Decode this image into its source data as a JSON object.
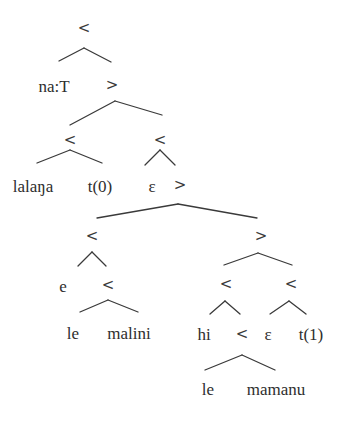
{
  "diagram": {
    "type": "syntax-tree",
    "nodes": [
      {
        "id": "n0",
        "label": "<",
        "x": 84,
        "y": 28,
        "kind": "operator"
      },
      {
        "id": "n1",
        "label": "na:T",
        "x": 54,
        "y": 86,
        "kind": "word"
      },
      {
        "id": "n2",
        "label": ">",
        "x": 112,
        "y": 85,
        "kind": "operator"
      },
      {
        "id": "n3",
        "label": "<",
        "x": 70,
        "y": 140,
        "kind": "operator"
      },
      {
        "id": "n4",
        "label": "<",
        "x": 160,
        "y": 140,
        "kind": "operator"
      },
      {
        "id": "n5",
        "label": "lalaŋa",
        "x": 33,
        "y": 186,
        "kind": "word"
      },
      {
        "id": "n6",
        "label": "t(0)",
        "x": 100,
        "y": 186,
        "kind": "word"
      },
      {
        "id": "n7",
        "label": "ε",
        "x": 152,
        "y": 186,
        "kind": "word"
      },
      {
        "id": "n8",
        "label": ">",
        "x": 180,
        "y": 185,
        "kind": "operator"
      },
      {
        "id": "n9",
        "label": "<",
        "x": 92,
        "y": 236,
        "kind": "operator"
      },
      {
        "id": "n10",
        "label": ">",
        "x": 261,
        "y": 236,
        "kind": "operator"
      },
      {
        "id": "n11",
        "label": "e",
        "x": 63,
        "y": 286,
        "kind": "word"
      },
      {
        "id": "n12",
        "label": "<",
        "x": 108,
        "y": 285,
        "kind": "operator"
      },
      {
        "id": "n13",
        "label": "<",
        "x": 226,
        "y": 284,
        "kind": "operator"
      },
      {
        "id": "n14",
        "label": "<",
        "x": 291,
        "y": 284,
        "kind": "operator"
      },
      {
        "id": "n15",
        "label": "le",
        "x": 73,
        "y": 333,
        "kind": "word"
      },
      {
        "id": "n16",
        "label": "malini",
        "x": 129,
        "y": 333,
        "kind": "word"
      },
      {
        "id": "n17",
        "label": "hi",
        "x": 204,
        "y": 334,
        "kind": "word"
      },
      {
        "id": "n18",
        "label": "<",
        "x": 242,
        "y": 334,
        "kind": "operator"
      },
      {
        "id": "n19",
        "label": "ε",
        "x": 268,
        "y": 334,
        "kind": "word"
      },
      {
        "id": "n20",
        "label": "t(1)",
        "x": 311,
        "y": 334,
        "kind": "word"
      },
      {
        "id": "n21",
        "label": "le",
        "x": 208,
        "y": 389,
        "kind": "word"
      },
      {
        "id": "n22",
        "label": "mamanu",
        "x": 276,
        "y": 389,
        "kind": "word"
      }
    ],
    "edges": [
      {
        "x1": 59,
        "y1": 61,
        "x2": 84,
        "y2": 48
      },
      {
        "x1": 84,
        "y1": 48,
        "x2": 111,
        "y2": 62
      },
      {
        "x1": 70,
        "y1": 125,
        "x2": 115,
        "y2": 101
      },
      {
        "x1": 115,
        "y1": 101,
        "x2": 162,
        "y2": 115
      },
      {
        "x1": 37,
        "y1": 163,
        "x2": 70,
        "y2": 150
      },
      {
        "x1": 70,
        "y1": 150,
        "x2": 102,
        "y2": 163
      },
      {
        "x1": 145,
        "y1": 165,
        "x2": 160,
        "y2": 150
      },
      {
        "x1": 160,
        "y1": 150,
        "x2": 175,
        "y2": 165
      },
      {
        "x1": 97,
        "y1": 218,
        "x2": 178,
        "y2": 204
      },
      {
        "x1": 178,
        "y1": 204,
        "x2": 257,
        "y2": 218
      },
      {
        "x1": 78,
        "y1": 266,
        "x2": 92,
        "y2": 252
      },
      {
        "x1": 92,
        "y1": 252,
        "x2": 106,
        "y2": 266
      },
      {
        "x1": 224,
        "y1": 265,
        "x2": 258,
        "y2": 253
      },
      {
        "x1": 258,
        "y1": 253,
        "x2": 292,
        "y2": 265
      },
      {
        "x1": 80,
        "y1": 312,
        "x2": 108,
        "y2": 300
      },
      {
        "x1": 108,
        "y1": 300,
        "x2": 138,
        "y2": 312
      },
      {
        "x1": 210,
        "y1": 314,
        "x2": 225,
        "y2": 301
      },
      {
        "x1": 225,
        "y1": 301,
        "x2": 240,
        "y2": 314
      },
      {
        "x1": 270,
        "y1": 314,
        "x2": 289,
        "y2": 301
      },
      {
        "x1": 289,
        "y1": 301,
        "x2": 306,
        "y2": 314
      },
      {
        "x1": 205,
        "y1": 370,
        "x2": 242,
        "y2": 355
      },
      {
        "x1": 242,
        "y1": 355,
        "x2": 275,
        "y2": 370
      }
    ]
  }
}
